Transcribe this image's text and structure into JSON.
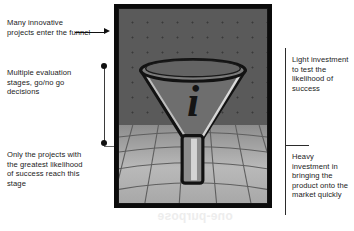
{
  "diagram": {
    "left_notes": [
      {
        "id": "note-top",
        "text": "Many innovative projects enter the funnel"
      },
      {
        "id": "note-mid",
        "text": "Multiple evaluation stages, go/no go decisions"
      },
      {
        "id": "note-bottom",
        "text": "Only the projects with the greatest likelihood of success reach this stage"
      }
    ],
    "right_notes": [
      {
        "id": "note-light",
        "text": "Light investment to test the likelihood of success"
      },
      {
        "id": "note-heavy",
        "text": "Heavy investment in bringing the product onto the market quickly"
      }
    ],
    "center_symbol": "i",
    "watermark": "one-purpose",
    "colors": {
      "page_background": "#ffffff",
      "frame": "#0b0b0b",
      "sky": "#5a5a5a",
      "sky_dots": "#3a3a3a",
      "ground_light": "#b9b9b9",
      "ground_dark": "#8d8d8d",
      "funnel_outline": "#121212",
      "funnel_fill": "#6e6e6e",
      "text": "#1b1b1b",
      "connector": "#111111",
      "watermark": "#ededed"
    }
  }
}
